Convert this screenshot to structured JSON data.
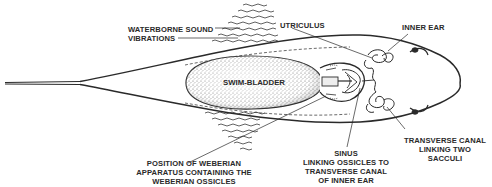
{
  "diagram": {
    "stroke_color": "#2a2a2a",
    "background": "#ffffff",
    "nodes": {
      "swim_bladder": {
        "label": "SWIM-BLADDER"
      },
      "weberian_ossicles": {
        "label": ""
      },
      "inner_ear": {
        "label": ""
      },
      "waves_top": {
        "label": ""
      },
      "waves_bottom": {
        "label": ""
      }
    },
    "labels": {
      "waterborne": {
        "line1": "WATERBORNE SOUND",
        "line2": "VIBRATIONS"
      },
      "utriculus": {
        "line1": "UTRICULUS"
      },
      "inner_ear": {
        "line1": "INNER EAR"
      },
      "weberian": {
        "line1": "POSITION OF WEBERIAN",
        "line2": "APPARATUS CONTAINING THE",
        "line3": "WEBERIAN OSSICLES"
      },
      "sinus": {
        "line1": "SINUS",
        "line2": "LINKING OSSICLES TO",
        "line3": "TRANSVERSE CANAL",
        "line4": "OF INNER EAR"
      },
      "transverse": {
        "line1": "TRANSVERSE CANAL",
        "line2": "LINKING TWO",
        "line3": "SACCULI"
      }
    },
    "edges": [
      {
        "from": "waterborne",
        "to": "waves_top"
      },
      {
        "from": "utriculus",
        "to": "inner_ear_utriculus"
      },
      {
        "from": "inner_ear",
        "to": "inner_ear_loop"
      },
      {
        "from": "weberian",
        "to": "weberian_ossicles"
      },
      {
        "from": "sinus",
        "to": "sinus_point"
      },
      {
        "from": "transverse",
        "to": "transverse_canal"
      }
    ]
  }
}
